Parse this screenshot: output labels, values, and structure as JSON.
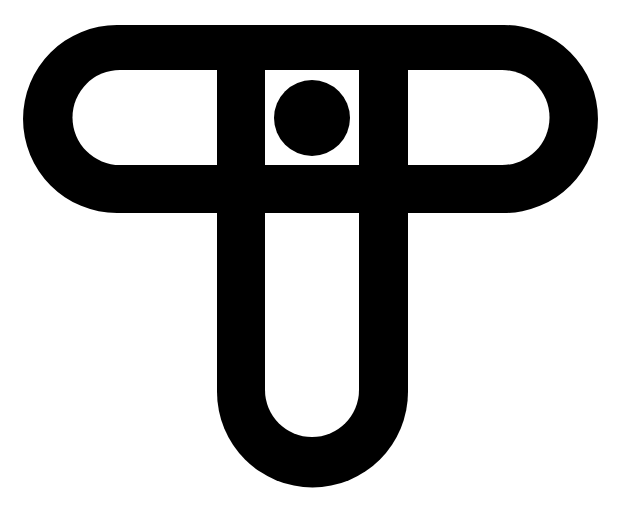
{
  "logo": {
    "description": "Abstract black monogram logo: a horizontal stadium ring crossed by a U-shaped loop, with a centered dot in a square opening",
    "colors": {
      "background": "#ffffff",
      "ink": "#000000"
    },
    "icon": "monogram-logo-icon"
  }
}
